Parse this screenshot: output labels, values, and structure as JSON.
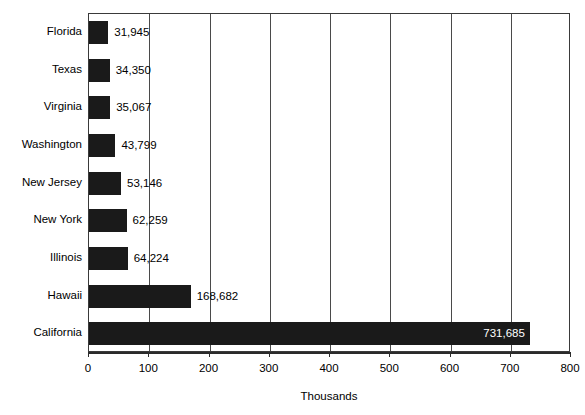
{
  "chart_data": {
    "type": "bar",
    "orientation": "horizontal",
    "title": "",
    "xlabel": "Thousands",
    "ylabel": "",
    "xlim": [
      0,
      800
    ],
    "xticks": [
      0,
      100,
      200,
      300,
      400,
      500,
      600,
      700,
      800
    ],
    "xtick_labels": [
      "0",
      "100",
      "200",
      "300",
      "400",
      "500",
      "600",
      "700",
      "800"
    ],
    "grid": "vertical",
    "legend": "none",
    "units": "thousands",
    "bar_color": "#1a1a1a",
    "categories": [
      "Florida",
      "Texas",
      "Virginia",
      "Washington",
      "New Jersey",
      "New York",
      "Illinois",
      "Hawaii",
      "California"
    ],
    "values": [
      31.945,
      34.35,
      35.067,
      43.799,
      53.146,
      62.259,
      64.224,
      168.682,
      731.685
    ],
    "data_labels": [
      "31,945",
      "34,350",
      "35,067",
      "43,799",
      "53,146",
      "62,259",
      "64,224",
      "168,682",
      "731,685"
    ],
    "label_placement": [
      "outside",
      "outside",
      "outside",
      "outside",
      "outside",
      "outside",
      "outside",
      "outside",
      "inside"
    ]
  }
}
